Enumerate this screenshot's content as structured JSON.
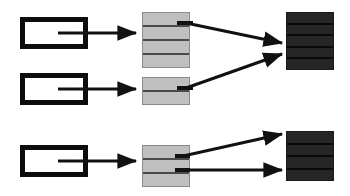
{
  "diagram": {
    "type": "block-flow-diagram",
    "canvas": {
      "width": 350,
      "height": 196,
      "background": "#ffffff"
    },
    "colors": {
      "background": "#ffffff",
      "source_fill": "#ffffff",
      "source_border": "#0d0d0d",
      "light_stack_fill": "#bfbfbf",
      "light_stack_border": "#8a8a8a",
      "light_stack_divider": "#4a4a4a",
      "dark_stack_fill": "#262626",
      "dark_stack_border": "#1a1a1a",
      "dark_stack_divider": "#0a0a0a",
      "arrow": "#111111"
    },
    "groups": [
      {
        "id": "group-top",
        "label": "top-group"
      },
      {
        "id": "group-bottom",
        "label": "bottom-group"
      }
    ],
    "source_rects": [
      {
        "id": "source-1",
        "group": "group-top",
        "x": 20,
        "y": 17,
        "width": 68,
        "height": 32,
        "fill": "#ffffff",
        "border_width": 5
      },
      {
        "id": "source-2",
        "group": "group-top",
        "x": 20,
        "y": 73,
        "width": 68,
        "height": 32,
        "fill": "#ffffff",
        "border_width": 5
      },
      {
        "id": "source-3",
        "group": "group-bottom",
        "x": 20,
        "y": 145,
        "width": 68,
        "height": 32,
        "fill": "#ffffff",
        "border_width": 5
      }
    ],
    "light_stacks": [
      {
        "id": "light-stack-1",
        "group": "group-top",
        "x": 142,
        "y": 12,
        "width": 48,
        "height": 56,
        "segments": 4
      },
      {
        "id": "light-stack-2",
        "group": "group-top",
        "x": 142,
        "y": 77,
        "width": 48,
        "height": 28,
        "segments": 2
      },
      {
        "id": "light-stack-3",
        "group": "group-bottom",
        "x": 142,
        "y": 145,
        "width": 48,
        "height": 42,
        "segments": 3
      }
    ],
    "dark_stacks": [
      {
        "id": "dark-stack-1",
        "group": "group-top",
        "x": 286,
        "y": 12,
        "width": 48,
        "height": 58,
        "segments": 5
      },
      {
        "id": "dark-stack-2",
        "group": "group-bottom",
        "x": 286,
        "y": 131,
        "width": 48,
        "height": 50,
        "segments": 4
      }
    ],
    "connectors": [
      {
        "id": "conn-src1-stack1",
        "from": "source-1",
        "to": "light-stack-1",
        "x1": 72,
        "y1": 33,
        "x2": 138,
        "y2": 33,
        "arrowhead": true,
        "stroke_width": 3
      },
      {
        "id": "conn-src2-stack2",
        "from": "source-2",
        "to": "light-stack-2",
        "x1": 72,
        "y1": 89,
        "x2": 138,
        "y2": 89,
        "arrowhead": true,
        "stroke_width": 3
      },
      {
        "id": "conn-src3-stack3",
        "from": "source-3",
        "to": "light-stack-3",
        "x1": 72,
        "y1": 161,
        "x2": 138,
        "y2": 161,
        "arrowhead": true,
        "stroke_width": 3
      },
      {
        "id": "conn-stack1-dark1",
        "from": "light-stack-1",
        "to": "dark-stack-1",
        "x1": 188,
        "y1": 23,
        "x2": 283,
        "y2": 43,
        "arrowhead": true,
        "stroke_width": 3
      },
      {
        "id": "conn-stack2-dark1",
        "from": "light-stack-2",
        "to": "dark-stack-1",
        "x1": 188,
        "y1": 88,
        "x2": 283,
        "y2": 54,
        "arrowhead": true,
        "stroke_width": 3
      },
      {
        "id": "conn-stack3-dark2a",
        "from": "light-stack-3",
        "to": "dark-stack-2",
        "x1": 184,
        "y1": 156,
        "x2": 283,
        "y2": 135,
        "arrowhead": true,
        "stroke_width": 3
      },
      {
        "id": "conn-stack3-dark2b",
        "from": "light-stack-3",
        "to": "dark-stack-2",
        "x1": 184,
        "y1": 170,
        "x2": 283,
        "y2": 170,
        "arrowhead": true,
        "stroke_width": 3
      }
    ],
    "stubs": [
      {
        "id": "stub-source-1",
        "x1": 58,
        "y1": 33,
        "x2": 74,
        "y2": 33,
        "stroke_width": 3
      },
      {
        "id": "stub-source-2",
        "x1": 58,
        "y1": 89,
        "x2": 74,
        "y2": 89,
        "stroke_width": 3
      },
      {
        "id": "stub-source-3",
        "x1": 58,
        "y1": 161,
        "x2": 74,
        "y2": 161,
        "stroke_width": 3
      },
      {
        "id": "stub-light-stack-1",
        "x1": 178,
        "y1": 23,
        "x2": 192,
        "y2": 23,
        "stroke_width": 4
      },
      {
        "id": "stub-light-stack-2",
        "x1": 178,
        "y1": 88,
        "x2": 192,
        "y2": 88,
        "stroke_width": 4
      },
      {
        "id": "stub-light-stack-3a",
        "x1": 176,
        "y1": 156,
        "x2": 190,
        "y2": 156,
        "stroke_width": 4
      },
      {
        "id": "stub-light-stack-3b",
        "x1": 176,
        "y1": 170,
        "x2": 190,
        "y2": 170,
        "stroke_width": 4
      }
    ]
  }
}
